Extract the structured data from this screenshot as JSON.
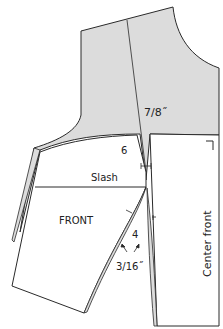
{
  "diagram": {
    "type": "sewing-pattern",
    "labels": {
      "dart_width": "7/8˝",
      "seam_top_number": "6",
      "slash": "Slash",
      "front": "FRONT",
      "seam_bottom_number": "4",
      "small_measure": "3/16˝",
      "center_front": "Center front"
    },
    "colors": {
      "fill": "#dcdcdc",
      "stroke": "#2a2a2a",
      "background": "#ffffff"
    }
  }
}
